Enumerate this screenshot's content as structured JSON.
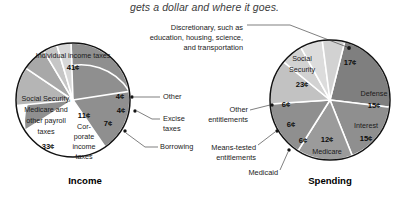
{
  "caption": "gets a dollar and where it goes.",
  "annotation": {
    "discretionary": {
      "line1": "Discretionary, such as",
      "line2": "education, housing, science,",
      "line3": "and transportation"
    }
  },
  "chart_data": [
    {
      "type": "pie",
      "title": "Income",
      "unit": "¢",
      "total": 100,
      "slices": [
        {
          "label": "Individual income taxes",
          "value_label": "41¢",
          "value": 41,
          "shade": "#8f8f8f",
          "placement": "inside"
        },
        {
          "label": "Social Security, Medicare and other payroll taxes",
          "value_label": "33¢",
          "value": 33,
          "shade": "#8f8f8f",
          "placement": "inside"
        },
        {
          "label": "Corporate income taxes",
          "value_label": "11¢",
          "value": 11,
          "shade": "#b5b5b5",
          "placement": "inside"
        },
        {
          "label": "Borrowing",
          "value_label": "7¢",
          "value": 7,
          "shade": "#a8a8a8",
          "placement": "callout"
        },
        {
          "label": "Excise taxes",
          "value_label": "4¢",
          "value": 4,
          "shade": "#c6c6c6",
          "placement": "callout"
        },
        {
          "label": "Other",
          "value_label": "4¢",
          "value": 4,
          "shade": "#d8d8d8",
          "placement": "callout"
        }
      ]
    },
    {
      "type": "pie",
      "title": "Spending",
      "unit": "¢",
      "total": 100,
      "slices": [
        {
          "label": "Discretionary",
          "value_label": "17¢",
          "value": 17,
          "shade": "#8f8f8f",
          "placement": "callout"
        },
        {
          "label": "Defense",
          "value_label": "15¢",
          "value": 15,
          "shade": "#9b9b9b",
          "placement": "inside"
        },
        {
          "label": "Interest",
          "value_label": "15¢",
          "value": 15,
          "shade": "#8f8f8f",
          "placement": "inside"
        },
        {
          "label": "Medicare",
          "value_label": "12¢",
          "value": 12,
          "shade": "#c2c2c2",
          "placement": "inside"
        },
        {
          "label": "Medicaid",
          "value_label": "6¢",
          "value": 6,
          "shade": "#d2d2d2",
          "placement": "callout"
        },
        {
          "label": "Means-tested entitlements",
          "value_label": "6¢",
          "value": 6,
          "shade": "#dcdcdc",
          "placement": "callout"
        },
        {
          "label": "Other entitlements",
          "value_label": "6¢",
          "value": 6,
          "shade": "#d2d2d2",
          "placement": "callout"
        },
        {
          "label": "Social Security",
          "value_label": "23¢",
          "value": 23,
          "shade": "#7f7f7f",
          "placement": "inside"
        }
      ]
    }
  ],
  "income": {
    "title": "Income",
    "individual": {
      "l1": "Individual income taxes",
      "v": "41¢"
    },
    "payroll": {
      "l1": "Social Security,",
      "l2": "Medicare and",
      "l3": "other payroll",
      "l4": "taxes",
      "v": "33¢"
    },
    "corporate": {
      "v": "11¢",
      "l1": "Cor-",
      "l2": "porate",
      "l3": "income",
      "l4": "taxes"
    },
    "borrowing": {
      "v": "7¢",
      "label": "Borrowing"
    },
    "excise": {
      "v": "4¢",
      "l1": "Excise",
      "l2": "taxes"
    },
    "other": {
      "v": "4¢",
      "label": "Other"
    }
  },
  "spending": {
    "title": "Spending",
    "social_security": {
      "l1": "Social",
      "l2": "Security",
      "v": "23¢"
    },
    "discretionary": {
      "v": "17¢"
    },
    "defense": {
      "label": "Defense",
      "v": "15¢"
    },
    "interest": {
      "label": "Interest",
      "v": "15¢"
    },
    "medicare": {
      "v": "12¢",
      "label": "Medicare"
    },
    "medicaid": {
      "v": "6¢",
      "label": "Medicaid"
    },
    "means_tested": {
      "v": "6¢",
      "l1": "Means-tested",
      "l2": "entitlements"
    },
    "other_entitlements": {
      "v": "6¢",
      "l1": "Other",
      "l2": "entitlements"
    }
  }
}
